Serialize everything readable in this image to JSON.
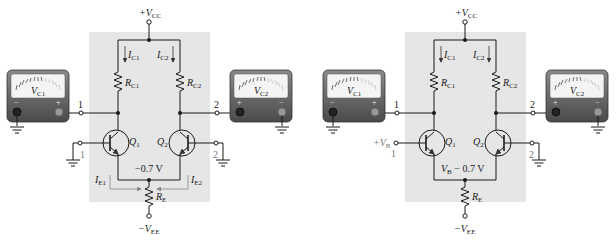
{
  "figure": {
    "panels": [
      {
        "id": "a",
        "supply_top": {
          "prefix": "+V",
          "sub": "CC"
        },
        "supply_bottom": {
          "prefix": "−V",
          "sub": "EE"
        },
        "currents": {
          "ic1": {
            "main": "I",
            "sub": "C1"
          },
          "ic2": {
            "main": "I",
            "sub": "C2"
          },
          "ie1": {
            "main": "I",
            "sub": "E1"
          },
          "ie2": {
            "main": "I",
            "sub": "E2"
          }
        },
        "resistors": {
          "rc1": {
            "main": "R",
            "sub": "C1"
          },
          "rc2": {
            "main": "R",
            "sub": "C2"
          },
          "re": {
            "main": "R",
            "sub": "E"
          }
        },
        "transistors": {
          "q1": {
            "main": "Q",
            "sub": "1"
          },
          "q2": {
            "main": "Q",
            "sub": "2"
          }
        },
        "emitter_voltage": "−0.7 V",
        "outputs": {
          "out1": "1",
          "out2": "2"
        },
        "inputs": {
          "in1": "1",
          "in2": "2"
        },
        "meters": {
          "left": {
            "main": "V",
            "sub": "C1",
            "minus": "−",
            "plus": "+"
          },
          "right": {
            "main": "V",
            "sub": "C2",
            "minus": "−",
            "plus": "+"
          }
        }
      },
      {
        "id": "b",
        "supply_top": {
          "prefix": "+V",
          "sub": "CC"
        },
        "supply_bottom": {
          "prefix": "−V",
          "sub": "EE"
        },
        "currents": {
          "ic1": {
            "main": "I",
            "sub": "C1"
          },
          "ic2": {
            "main": "I",
            "sub": "C2"
          }
        },
        "resistors": {
          "rc1": {
            "main": "R",
            "sub": "C1"
          },
          "rc2": {
            "main": "R",
            "sub": "C2"
          },
          "re": {
            "main": "R",
            "sub": "E"
          }
        },
        "transistors": {
          "q1": {
            "main": "Q",
            "sub": "1"
          },
          "q2": {
            "main": "Q",
            "sub": "2"
          }
        },
        "input_voltage": {
          "prefix": "+V",
          "sub": "B"
        },
        "emitter_voltage": {
          "prefix": "V",
          "sub": "B",
          "suffix": " − 0.7 V"
        },
        "outputs": {
          "out1": "1",
          "out2": "2"
        },
        "inputs": {
          "in1": "1",
          "in2": "2"
        },
        "meters": {
          "left": {
            "main": "V",
            "sub": "C1",
            "minus": "−",
            "plus": "+"
          },
          "right": {
            "main": "V",
            "sub": "C2",
            "minus": "−",
            "plus": "+"
          }
        }
      }
    ],
    "colors": {
      "panel_bg": "#e6e6e6",
      "wire": "#1a1a1a",
      "meter_body": "#5e5e5e",
      "meter_face": "#f4f4f4",
      "arrow": "#888888"
    }
  }
}
